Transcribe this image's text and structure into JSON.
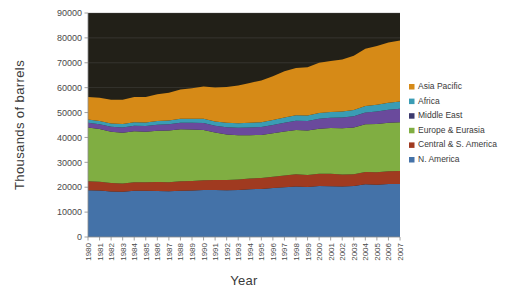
{
  "chart_data": {
    "type": "area",
    "title": "",
    "xlabel": "Year",
    "ylabel": "Thousands of barrels",
    "stacked": true,
    "grid": true,
    "legend_position": "right",
    "plot_background_color": "#222018",
    "xlim": [
      1980,
      2007
    ],
    "ylim": [
      0,
      90000
    ],
    "ytick_step": 10000,
    "ytick_labels": [
      "0",
      "10000",
      "20000",
      "30000",
      "40000",
      "50000",
      "60000",
      "70000",
      "80000",
      "90000"
    ],
    "ytick_values": [
      0,
      10000,
      20000,
      30000,
      40000,
      50000,
      60000,
      70000,
      80000,
      90000
    ],
    "x": [
      1980,
      1981,
      1982,
      1983,
      1984,
      1985,
      1986,
      1987,
      1988,
      1989,
      1990,
      1991,
      1992,
      1993,
      1994,
      1995,
      1996,
      1997,
      1998,
      1999,
      2000,
      2001,
      2002,
      2003,
      2004,
      2005,
      2006,
      2007
    ],
    "xtick_labels": [
      "1980",
      "1981",
      "1982",
      "1983",
      "1984",
      "1985",
      "1986",
      "1987",
      "1988",
      "1989",
      "1990",
      "1991",
      "1992",
      "1993",
      "1994",
      "1995",
      "1996",
      "1997",
      "1998",
      "1999",
      "2000",
      "2001",
      "2002",
      "2003",
      "2004",
      "2005",
      "2006",
      "2007"
    ],
    "series": [
      {
        "name": "N. America",
        "color": "#4472a8",
        "values": [
          18800,
          18700,
          18300,
          18200,
          18600,
          18600,
          18500,
          18400,
          18600,
          18700,
          18900,
          18900,
          18800,
          18900,
          19200,
          19300,
          19700,
          20000,
          20300,
          20100,
          20500,
          20400,
          20300,
          20500,
          21200,
          21000,
          21300,
          21300
        ]
      },
      {
        "name": "Central & S. America",
        "color": "#a03a20",
        "values": [
          3600,
          3500,
          3400,
          3300,
          3400,
          3400,
          3600,
          3600,
          3800,
          3800,
          3900,
          4000,
          4100,
          4200,
          4300,
          4400,
          4500,
          4700,
          4900,
          4800,
          4900,
          5000,
          4800,
          4700,
          4900,
          5000,
          5100,
          5200
        ]
      },
      {
        "name": "Europe & Eurasia",
        "color": "#80ae42",
        "values": [
          21600,
          21200,
          20600,
          20400,
          20500,
          20300,
          20600,
          20800,
          20900,
          20700,
          20200,
          19100,
          18300,
          17800,
          17400,
          17300,
          17500,
          17700,
          17800,
          17900,
          18100,
          18400,
          18600,
          18800,
          19200,
          19400,
          19500,
          19600
        ]
      },
      {
        "name": "Middle East",
        "color": "#6a4a9c",
        "values": [
          1900,
          1900,
          2000,
          2100,
          2200,
          2300,
          2400,
          2500,
          2600,
          2700,
          2800,
          2700,
          2900,
          3000,
          3100,
          3200,
          3300,
          3500,
          3700,
          3800,
          4000,
          4100,
          4300,
          4500,
          4700,
          5000,
          5200,
          5400
        ]
      },
      {
        "name": "Africa",
        "color": "#3a9cb4"
      },
      {
        "name": "Asia Pacific",
        "color": "#d68a17",
        "values": [
          9000,
          9300,
          9500,
          9700,
          10100,
          10300,
          10800,
          11200,
          11800,
          12300,
          13000,
          13700,
          14400,
          15200,
          16000,
          16800,
          17600,
          18600,
          19000,
          19400,
          20200,
          20500,
          20900,
          21800,
          23000,
          23600,
          24200,
          24600
        ]
      }
    ],
    "series_africa_values": [
      1300,
      1300,
      1300,
      1400,
      1400,
      1400,
      1500,
      1500,
      1600,
      1600,
      1700,
      1700,
      1800,
      1800,
      1900,
      1900,
      2000,
      2100,
      2200,
      2200,
      2300,
      2300,
      2400,
      2500,
      2600,
      2700,
      2800,
      2900
    ],
    "totals": [
      56200,
      55900,
      55100,
      55100,
      56200,
      56300,
      57400,
      58000,
      59300,
      59800,
      60500,
      60100,
      60300,
      60900,
      61900,
      62900,
      64600,
      66600,
      67900,
      68200,
      70000,
      70700,
      71300,
      73800,
      76600,
      77700,
      79100,
      79000
    ]
  },
  "legend": {
    "items": [
      {
        "label": "Asia Pacific",
        "color": "#d68a17"
      },
      {
        "label": "Africa",
        "color": "#3a9cb4"
      },
      {
        "label": "Middle East",
        "color": "#3c3a6e"
      },
      {
        "label": "Europe & Eurasia",
        "color": "#80ae42"
      },
      {
        "label": "Central & S. America",
        "color": "#a03a20"
      },
      {
        "label": "N. America",
        "color": "#4472a8"
      }
    ]
  },
  "axis": {
    "y_title": "Thousands of barrels",
    "x_title": "Year"
  }
}
